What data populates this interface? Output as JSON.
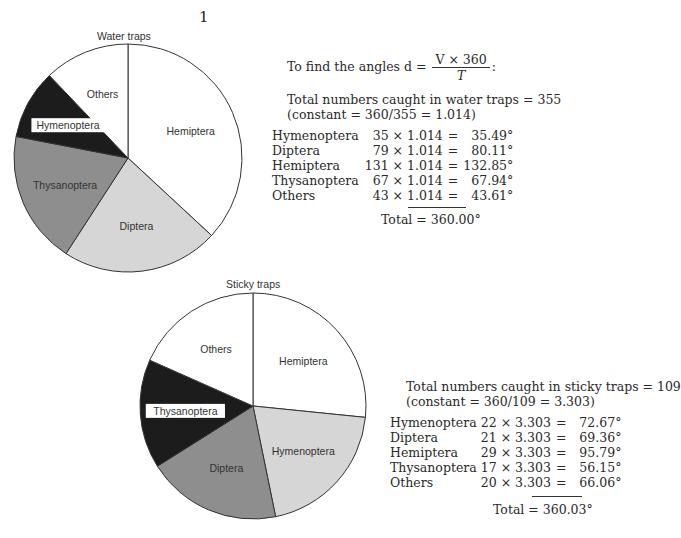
{
  "page_number": "1",
  "formula": {
    "prefix": "To find the angles d =",
    "numerator": "V × 360",
    "denominator": "T",
    "suffix": ":"
  },
  "water": {
    "title": "Water traps",
    "total_line": "Total numbers caught in water traps = 355",
    "constant_line": "(constant = 360/355 = 1.014)",
    "rows": [
      {
        "name": "Hymenoptera",
        "expr": "35 × 1.014",
        "eq": "=",
        "val": "35.49°"
      },
      {
        "name": "Diptera",
        "expr": "79 × 1.014",
        "eq": "=",
        "val": "80.11°"
      },
      {
        "name": "Hemiptera",
        "expr": "131 × 1.014",
        "eq": "=",
        "val": "132.85°"
      },
      {
        "name": "Thysanoptera",
        "expr": "67 × 1.014",
        "eq": "=",
        "val": "67.94°"
      },
      {
        "name": "Others",
        "expr": "43 × 1.014",
        "eq": "=",
        "val": "43.61°"
      }
    ],
    "total": "Total = 360.00°"
  },
  "sticky": {
    "title": "Sticky traps",
    "total_line": "Total numbers caught in sticky traps = 109",
    "constant_line": "(constant = 360/109 = 3.303)",
    "rows": [
      {
        "name": "Hymenoptera",
        "expr": "22 × 3.303",
        "eq": "=",
        "val": "72.67°"
      },
      {
        "name": "Diptera",
        "expr": "21 × 3.303",
        "eq": "=",
        "val": "69.36°"
      },
      {
        "name": "Hemiptera",
        "expr": "29 × 3.303",
        "eq": "=",
        "val": "95.79°"
      },
      {
        "name": "Thysanoptera",
        "expr": "17 × 3.303",
        "eq": "=",
        "val": "56.15°"
      },
      {
        "name": "Others",
        "expr": "20 × 3.303",
        "eq": "=",
        "val": "66.06°"
      }
    ],
    "total": "Total = 360.03°"
  },
  "chart_data": [
    {
      "type": "pie",
      "title": "Water traps",
      "categories": [
        "Hemiptera",
        "Diptera",
        "Thysanoptera",
        "Hymenoptera",
        "Others"
      ],
      "counts": [
        131,
        79,
        67,
        35,
        43
      ],
      "values": [
        132.85,
        80.11,
        67.94,
        35.49,
        43.61
      ],
      "units": "degrees",
      "start_angle": "12 o'clock, clockwise",
      "fills": [
        "#ffffff",
        "#d6d6d6",
        "#8e8e8e",
        "#1c1c1c",
        "#ffffff"
      ],
      "labels_boxed": [
        "Hymenoptera"
      ]
    },
    {
      "type": "pie",
      "title": "Sticky traps",
      "categories": [
        "Hemiptera",
        "Hymenoptera",
        "Diptera",
        "Thysanoptera",
        "Others"
      ],
      "counts": [
        29,
        22,
        21,
        17,
        20
      ],
      "values": [
        95.79,
        72.67,
        69.36,
        56.15,
        66.06
      ],
      "units": "degrees",
      "start_angle": "12 o'clock, clockwise",
      "fills": [
        "#ffffff",
        "#d6d6d6",
        "#8e8e8e",
        "#1c1c1c",
        "#ffffff"
      ],
      "labels_boxed": [
        "Thysanoptera"
      ]
    }
  ]
}
